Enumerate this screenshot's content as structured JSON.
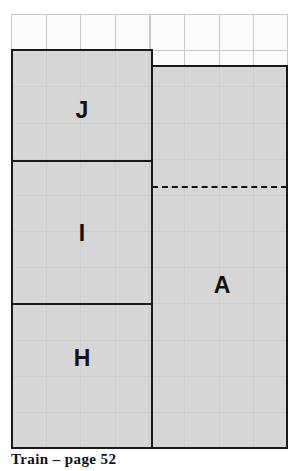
{
  "figure": {
    "caption": "Train – page 52",
    "grid": {
      "columns": 8,
      "rows": 12,
      "cell_width_px": 34.6,
      "cell_height_px": 36.2,
      "line_color": "#c9c9c9",
      "paper_color": "#fbfbfb"
    },
    "fill_color": "#d6d6d6",
    "outline_color": "#1a1a1a",
    "pieces": [
      {
        "id": "J",
        "label": "J",
        "label_x": 82,
        "label_y": 110,
        "x": 11,
        "y": 50,
        "w": 141,
        "h": 111
      },
      {
        "id": "I",
        "label": "I",
        "label_x": 82,
        "label_y": 233,
        "x": 11,
        "y": 161,
        "w": 141,
        "h": 143
      },
      {
        "id": "H",
        "label": "H",
        "label_x": 82,
        "label_y": 358,
        "x": 11,
        "y": 304,
        "w": 141,
        "h": 144
      },
      {
        "id": "A",
        "label": "A",
        "label_x": 222,
        "label_y": 285,
        "x": 152,
        "y": 66,
        "w": 136,
        "h": 382
      }
    ],
    "dashed_divider": {
      "x": 152,
      "y": 187,
      "w": 136
    }
  }
}
